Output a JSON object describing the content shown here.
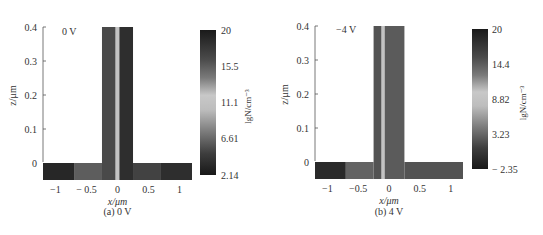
{
  "chart_data": [
    {
      "type": "heatmap",
      "panel_label": "(a) 0 V",
      "annotation": "0 V",
      "xlabel": "x/μm",
      "ylabel": "z/μm",
      "xlim": [
        -1.2,
        1.2
      ],
      "ylim": [
        -0.05,
        0.4
      ],
      "xticks": [
        -1,
        -0.5,
        0,
        0.5,
        1
      ],
      "xtick_labels": [
        "−1",
        "− 0.5",
        "0",
        "0.5",
        "1"
      ],
      "yticks": [
        0,
        0.1,
        0.2,
        0.3,
        0.4
      ],
      "ytick_labels": [
        "0",
        "0.1",
        "0.2",
        "0.3",
        "0.4"
      ],
      "structure": {
        "fin_x": [
          -0.25,
          0.25
        ],
        "fin_z": [
          0,
          0.4
        ],
        "substrate_x": [
          -1.2,
          1.2
        ],
        "substrate_z": [
          -0.05,
          0
        ]
      },
      "regions": [
        {
          "name": "substrate-left-outer",
          "x": [
            -1.2,
            -0.7
          ],
          "z": [
            -0.05,
            0
          ],
          "value": 19
        },
        {
          "name": "substrate-left-inner",
          "x": [
            -0.7,
            -0.25
          ],
          "z": [
            -0.05,
            0
          ],
          "value": 15.5
        },
        {
          "name": "fin-left",
          "x": [
            -0.25,
            -0.03
          ],
          "z": [
            -0.05,
            0.4
          ],
          "value": 16.5
        },
        {
          "name": "fin-center",
          "x": [
            -0.03,
            0.03
          ],
          "z": [
            -0.05,
            0.4
          ],
          "value": 11.1
        },
        {
          "name": "fin-right",
          "x": [
            0.03,
            0.25
          ],
          "z": [
            -0.05,
            0.4
          ],
          "value": 18.5
        },
        {
          "name": "substrate-right-inner",
          "x": [
            0.25,
            0.7
          ],
          "z": [
            -0.05,
            0
          ],
          "value": 17
        },
        {
          "name": "substrate-right-outer",
          "x": [
            0.7,
            1.2
          ],
          "z": [
            -0.05,
            0
          ],
          "value": 18.5
        }
      ],
      "colorbar": {
        "label": "lgN/cm⁻³",
        "range": [
          2.14,
          20
        ],
        "ticks": [
          20,
          15.5,
          11.1,
          6.61,
          2.14
        ],
        "tick_labels": [
          "20",
          "15.5",
          "11.1",
          "6.61",
          "2.14"
        ]
      }
    },
    {
      "type": "heatmap",
      "panel_label": "(b) 4 V",
      "annotation": "−4 V",
      "xlabel": "x/μm",
      "ylabel": "z/μm",
      "xlim": [
        -1.2,
        1.2
      ],
      "ylim": [
        -0.05,
        0.4
      ],
      "xticks": [
        -1,
        -0.5,
        0,
        0.5,
        1
      ],
      "xtick_labels": [
        "−1",
        "−0.5",
        "0",
        "0.5",
        "1"
      ],
      "yticks": [
        0,
        0.1,
        0.2,
        0.3,
        0.4
      ],
      "ytick_labels": [
        "0",
        "0.1",
        "0.2",
        "0.3",
        "0.4"
      ],
      "structure": {
        "fin_x": [
          -0.25,
          0.25
        ],
        "fin_z": [
          0,
          0.4
        ],
        "substrate_x": [
          -1.2,
          1.2
        ],
        "substrate_z": [
          -0.05,
          0
        ]
      },
      "regions": [
        {
          "name": "substrate-left-outer",
          "x": [
            -1.2,
            -0.7
          ],
          "z": [
            -0.05,
            0
          ],
          "value": 18.5
        },
        {
          "name": "substrate-left-inner",
          "x": [
            -0.7,
            -0.25
          ],
          "z": [
            -0.05,
            0
          ],
          "value": 14
        },
        {
          "name": "fin-left",
          "x": [
            -0.25,
            -0.12
          ],
          "z": [
            -0.05,
            0.4
          ],
          "value": 15
        },
        {
          "name": "fin-center",
          "x": [
            -0.12,
            -0.07
          ],
          "z": [
            -0.05,
            0.4
          ],
          "value": 9
        },
        {
          "name": "fin-right",
          "x": [
            -0.07,
            0.25
          ],
          "z": [
            -0.05,
            0.4
          ],
          "value": 14.5
        },
        {
          "name": "substrate-right",
          "x": [
            0.25,
            1.2
          ],
          "z": [
            -0.05,
            0
          ],
          "value": 15
        }
      ],
      "colorbar": {
        "label": "lgN/cm⁻³",
        "range": [
          -2.35,
          20
        ],
        "ticks": [
          20,
          14.4,
          8.82,
          3.23,
          -2.35
        ],
        "tick_labels": [
          "20",
          "14.4",
          "8.82",
          "3.23",
          "− 2.35"
        ]
      }
    }
  ]
}
